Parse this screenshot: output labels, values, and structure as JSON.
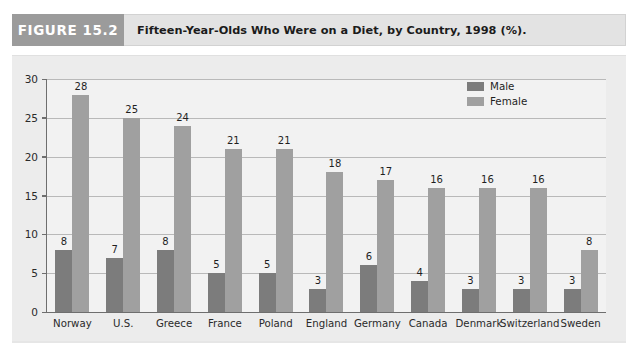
{
  "figure": {
    "badge_label": "FIGURE 15.2",
    "title": "Fifteen-Year-Olds Who Were on a Diet, by Country, 1998 (%)."
  },
  "legend": {
    "position": "top-right",
    "items": [
      {
        "label": "Male",
        "color": "#7c7c7c"
      },
      {
        "label": "Female",
        "color": "#a0a0a0"
      }
    ]
  },
  "axis": {
    "y_ticks": [
      "30",
      "25",
      "20",
      "15",
      "10",
      "5",
      "0"
    ]
  },
  "chart_data": {
    "type": "bar",
    "title": "Fifteen-Year-Olds Who Were on a Diet, by Country, 1998 (%).",
    "xlabel": "",
    "ylabel": "",
    "ylim": [
      0,
      30
    ],
    "ytick_step": 5,
    "grid": true,
    "legend_position": "top-right",
    "categories": [
      "Norway",
      "U.S.",
      "Greece",
      "France",
      "Poland",
      "England",
      "Germany",
      "Canada",
      "Denmark",
      "Switzerland",
      "Sweden"
    ],
    "series": [
      {
        "name": "Male",
        "color": "#7c7c7c",
        "values": [
          8,
          7,
          8,
          5,
          5,
          3,
          6,
          4,
          3,
          3,
          3
        ]
      },
      {
        "name": "Female",
        "color": "#a0a0a0",
        "values": [
          28,
          25,
          24,
          21,
          21,
          18,
          17,
          16,
          16,
          16,
          8
        ]
      }
    ]
  }
}
